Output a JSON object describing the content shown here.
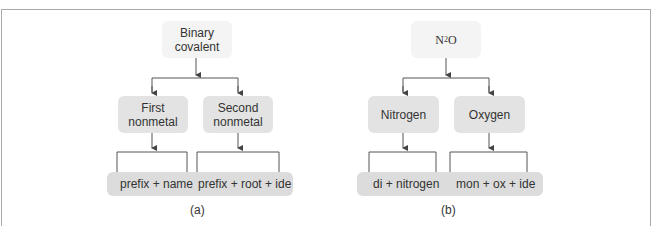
{
  "diagram_a": {
    "root": {
      "line1": "Binary",
      "line2": "covalent"
    },
    "left": {
      "line1": "First",
      "line2": "nonmetal"
    },
    "right": {
      "line1": "Second",
      "line2": "nonmetal"
    },
    "bottom_left": "prefix + name",
    "bottom_right": "prefix + root + ide",
    "caption": "(a)"
  },
  "diagram_b": {
    "root": {
      "formula_main": "N",
      "formula_sub": "2",
      "formula_rest": "O"
    },
    "left": "Nitrogen",
    "right": "Oxygen",
    "bottom_left": "di + nitrogen",
    "bottom_right": "mon + ox + ide",
    "caption": "(b)"
  },
  "colors": {
    "frame": "#a9a9a9",
    "top_box": "#f4f4f4",
    "mid_box": "#e3e3e3",
    "bottom_bar": "#dcdcdc",
    "line": "#444444"
  }
}
